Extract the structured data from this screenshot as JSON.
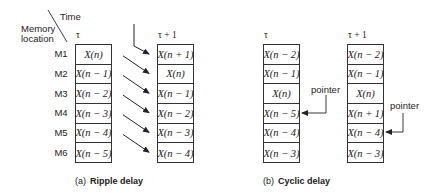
{
  "ripple": {
    "axis_time_label": "Time",
    "axis_memory_label_line1": "Memory",
    "axis_memory_label_line2": "location",
    "col_tau": "τ",
    "col_tau_plus_1": "τ + 1",
    "memory_locations": [
      "M1",
      "M2",
      "M3",
      "M4",
      "M5",
      "M6"
    ],
    "tau_cells": [
      "X(n)",
      "X(n − 1)",
      "X(n − 2)",
      "X(n − 3)",
      "X(n − 4)",
      "X(n − 5)"
    ],
    "tau_plus_1_cells": [
      "X(n + 1)",
      "X(n)",
      "X(n − 1)",
      "X(n − 2)",
      "X(n − 3)",
      "X(n − 4)"
    ],
    "caption_tag": "(a)",
    "caption_title": "Ripple delay"
  },
  "cyclic": {
    "col_tau": "τ",
    "col_tau_plus_1": "τ + 1",
    "tau_cells": [
      "X(n − 2)",
      "X(n − 1)",
      "X(n)",
      "X(n − 5)",
      "X(n − 4)",
      "X(n − 3)"
    ],
    "tau_plus_1_cells": [
      "X(n − 2)",
      "X(n − 1)",
      "X(n)",
      "X(n + 1)",
      "X(n − 4)",
      "X(n − 3)"
    ],
    "pointer_label_tau": "pointer",
    "pointer_label_tau_plus_1": "pointer",
    "pointer_row_tau": 4,
    "pointer_row_tau_plus_1": 5,
    "caption_tag": "(b)",
    "caption_title": "Cyclic delay"
  }
}
